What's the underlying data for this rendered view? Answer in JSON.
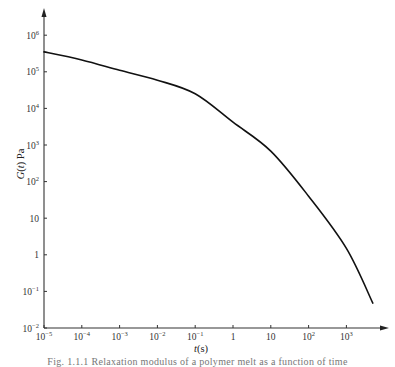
{
  "chart_data": {
    "type": "line",
    "title": "",
    "xlabel": "t(s)",
    "ylabel": "G(t) Pa",
    "xscale": "log",
    "yscale": "log",
    "xlim": [
      1e-05,
      5000
    ],
    "ylim": [
      0.01,
      1000000
    ],
    "grid": false,
    "legend": "none",
    "x_tick_labels": [
      "10^-5",
      "10^-4",
      "10^-3",
      "10^-2",
      "10^-1",
      "1",
      "10",
      "10^2",
      "10^3"
    ],
    "y_tick_labels": [
      "10^-2",
      "10^-1",
      "1",
      "10",
      "10^2",
      "10^3",
      "10^4",
      "10^5",
      "10^6"
    ],
    "series": [
      {
        "name": "G(t)",
        "x": [
          1e-05,
          0.0001,
          0.001,
          0.01,
          0.1,
          1,
          10,
          100,
          1000,
          5000
        ],
        "values": [
          350000,
          210000,
          110000,
          59000,
          25000,
          4200,
          680,
          40,
          1.5,
          0.048
        ]
      }
    ]
  },
  "axes": {
    "x_title_var": "t",
    "x_title_unit": "(s)",
    "y_title_var": "G(t)",
    "y_title_unit": "Pa"
  },
  "caption": "Fig. 1.1.1  Relaxation modulus of a polymer melt as a function of time"
}
